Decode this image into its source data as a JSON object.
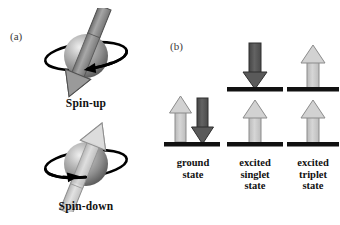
{
  "figure": {
    "background_color": "#ffffff",
    "width": 340,
    "height": 225
  },
  "panel_a": {
    "letter": "(a)",
    "items": [
      {
        "id": "spin-up",
        "caption": "Spin-up",
        "arrow_direction": "down-left",
        "arrow_color": "#8e8e8e",
        "rotation_sense": "arrowhead-front-right-pointing-left"
      },
      {
        "id": "spin-down",
        "caption": "Spin-down",
        "arrow_direction": "up-right",
        "arrow_color": "#cfcfcf",
        "rotation_sense": "arrowhead-front-left-pointing-right"
      }
    ],
    "sphere_colors": {
      "highlight": "#e8e8e8",
      "mid": "#a9a9a9",
      "shadow": "#6b6b6b"
    },
    "orbit_color": "#000000"
  },
  "panel_b": {
    "letter": "(b)",
    "level_bar_color": "#111111",
    "arrow_light_color": "#c9c9c9",
    "arrow_dark_color": "#555555",
    "columns": [
      {
        "id": "ground",
        "label_lines": [
          "ground",
          "state"
        ],
        "levels": [
          {
            "id": "ground-lower-level",
            "position": "lower",
            "arrows": [
              {
                "direction": "up",
                "shade": "light"
              },
              {
                "direction": "down",
                "shade": "dark"
              }
            ]
          }
        ]
      },
      {
        "id": "singlet",
        "label_lines": [
          "excited",
          "singlet",
          "state"
        ],
        "levels": [
          {
            "id": "singlet-upper-level",
            "position": "upper",
            "arrows": [
              {
                "direction": "down",
                "shade": "dark"
              }
            ]
          },
          {
            "id": "singlet-lower-level",
            "position": "lower",
            "arrows": [
              {
                "direction": "up",
                "shade": "light"
              }
            ]
          }
        ]
      },
      {
        "id": "triplet",
        "label_lines": [
          "excited",
          "triplet",
          "state"
        ],
        "levels": [
          {
            "id": "triplet-upper-level",
            "position": "upper",
            "arrows": [
              {
                "direction": "up",
                "shade": "light"
              }
            ]
          },
          {
            "id": "triplet-lower-level",
            "position": "lower",
            "arrows": [
              {
                "direction": "up",
                "shade": "light"
              }
            ]
          }
        ]
      }
    ]
  }
}
